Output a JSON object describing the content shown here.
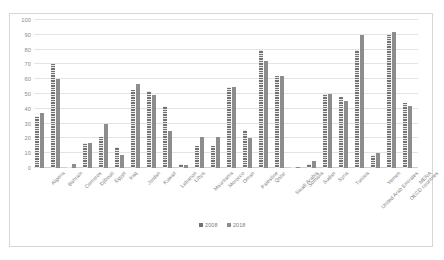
{
  "chart_data": {
    "type": "bar",
    "title": "",
    "subtitle": "",
    "xlabel": "",
    "ylabel": "",
    "ylim": [
      0,
      100
    ],
    "yticks": [
      0,
      10,
      20,
      30,
      40,
      50,
      60,
      70,
      80,
      90,
      100
    ],
    "grid": true,
    "legend_position": "bottom",
    "categories": [
      "Algeria",
      "Bahrain",
      "Comoros",
      "Djibouti",
      "Egypt",
      "Iraq",
      "Jordan",
      "Kuwait",
      "Lebanon",
      "Libya",
      "Mauritania",
      "Morocco",
      "Oman",
      "Palestine",
      "Qatar",
      "Saudi Arabia",
      "Somalia",
      "Sudan",
      "Syria",
      "Tunisia",
      "United Arab Emirates",
      "Yemen",
      "OECD countries",
      "MENA"
    ],
    "series": [
      {
        "name": "2008",
        "color": "#737373",
        "values": [
          35,
          70,
          1,
          17,
          21,
          14,
          53,
          52,
          42,
          3,
          15,
          15,
          55,
          26,
          80,
          62,
          1,
          3,
          50,
          48,
          80,
          9,
          90,
          44
        ]
      },
      {
        "name": "2018",
        "color": "#8d8d8d",
        "values": [
          37,
          60,
          3,
          17,
          30,
          9,
          57,
          49,
          25,
          2,
          21,
          21,
          55,
          20,
          72,
          62,
          1,
          5,
          50,
          45,
          90,
          10,
          92,
          42
        ]
      }
    ]
  },
  "legend": {
    "items": [
      {
        "label": "2008"
      },
      {
        "label": "2018"
      }
    ]
  }
}
